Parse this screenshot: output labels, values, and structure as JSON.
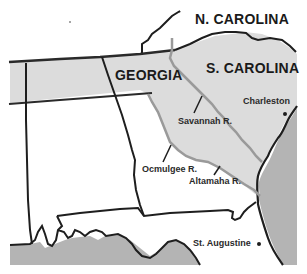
{
  "map": {
    "title": "",
    "colors": {
      "background": "#ffffff",
      "land_shaded": "#dcdcdc",
      "ocean": "#b4b4b4",
      "border": "#1e1e1e",
      "river": "#9a9a9a"
    },
    "states": [
      {
        "id": "nc",
        "label": "N. CAROLINA"
      },
      {
        "id": "sc",
        "label": "S. CAROLINA"
      },
      {
        "id": "ga",
        "label": "GEORGIA"
      }
    ],
    "rivers": [
      {
        "id": "savannah",
        "label": "Savannah R."
      },
      {
        "id": "ocmulgee",
        "label": "Ocmulgee R."
      },
      {
        "id": "altamaha",
        "label": "Altamaha R."
      }
    ],
    "cities": [
      {
        "id": "charleston",
        "label": "Charleston"
      },
      {
        "id": "st-augustine",
        "label": "St. Augustine"
      }
    ]
  }
}
